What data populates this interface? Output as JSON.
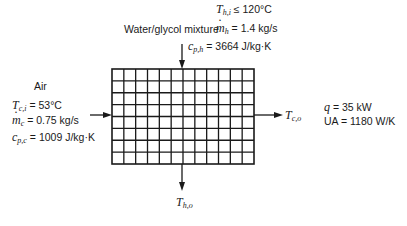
{
  "hot_stream": {
    "label": "Water/glycol mixture",
    "inlet_temp": {
      "symbol": "T",
      "sub": "h,i",
      "relation": "≤",
      "value": "120°C"
    },
    "mass_flow": {
      "symbol": "m",
      "sub": "h",
      "relation": "=",
      "value": "1.4 kg/s"
    },
    "specific_heat": {
      "symbol": "c",
      "sub": "p,h",
      "relation": "=",
      "value": "3664 J/kg·K"
    },
    "outlet": {
      "symbol": "T",
      "sub": "h,o"
    }
  },
  "cold_stream": {
    "label": "Air",
    "inlet_temp": {
      "symbol": "T",
      "sub": "c,i",
      "relation": "=",
      "value": "53°C"
    },
    "mass_flow": {
      "symbol": "m",
      "sub": "c",
      "relation": "=",
      "value": "0.75 kg/s"
    },
    "specific_heat": {
      "symbol": "c",
      "sub": "p,c",
      "relation": "=",
      "value": "1009 J/kg·K"
    },
    "outlet": {
      "symbol": "T",
      "sub": "c,o"
    }
  },
  "performance": {
    "q": {
      "symbol": "q",
      "relation": "=",
      "value": "35 kW"
    },
    "ua": {
      "symbol": "UA",
      "relation": "=",
      "value": "1180 W/K"
    }
  },
  "exchanger_grid": {
    "columns": 12,
    "rows": 8
  }
}
